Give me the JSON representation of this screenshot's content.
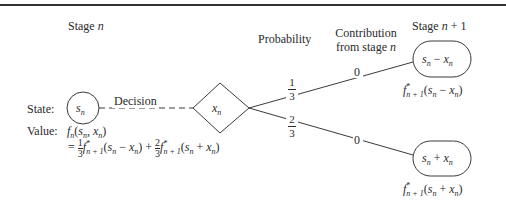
{
  "diagram": {
    "headers": {
      "stage_n": "Stage n",
      "probability": "Probability",
      "contribution_line1": "Contribution",
      "contribution_line2": "from stage n",
      "stage_n_plus_1": "Stage n + 1"
    },
    "left_labels": {
      "state": "State:",
      "value": "Value:"
    },
    "state_node": {
      "label": "s",
      "sub": "n"
    },
    "decision_label": "Decision",
    "decision_node": {
      "label": "x",
      "sub": "n"
    },
    "branches": [
      {
        "probability_num": "1",
        "probability_den": "3",
        "contribution": "0",
        "next_state": "s_n − x_n",
        "next_value": "f*_{n+1}(s_n − x_n)"
      },
      {
        "probability_num": "2",
        "probability_den": "3",
        "contribution": "0",
        "next_state": "s_n + x_n",
        "next_value": "f*_{n+1}(s_n + x_n)"
      }
    ],
    "value_formula": {
      "line1": "f_n(s_n, x_n)",
      "line2": "= 1/3 f*_{n+1}(s_n − x_n) + 2/3 f*_{n+1}(s_n + x_n)"
    },
    "colors": {
      "stroke": "#3a3a3a",
      "text": "#2a2a2a",
      "background": "#ffffff"
    }
  }
}
